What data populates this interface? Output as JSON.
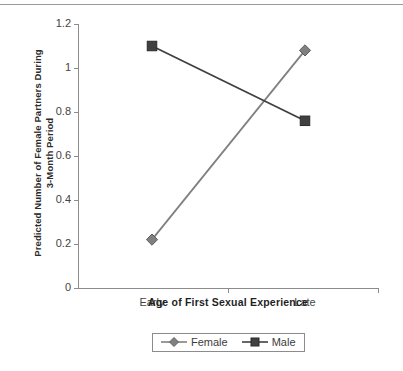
{
  "chart_data": {
    "type": "line",
    "title": "",
    "subtitle": "",
    "xlabel": "Age of First Sexual Experience",
    "ylabel": "Predicted Number of Female Partners During 3-Month Period",
    "ylabel_line1": "Predicted Number of Female Partners During",
    "ylabel_line2": "3-Month Period",
    "categories": [
      "Early",
      "Late"
    ],
    "series": [
      {
        "name": "Female",
        "values": [
          0.22,
          1.08
        ],
        "color": "#808080",
        "marker": "diamond"
      },
      {
        "name": "Male",
        "values": [
          1.1,
          0.76
        ],
        "color": "#404040",
        "marker": "square"
      }
    ],
    "ylim": [
      0,
      1.2
    ],
    "ytick_values": [
      0,
      0.2,
      0.4,
      0.6,
      0.8,
      1,
      1.2
    ],
    "ytick_labels": [
      "0",
      "0.2",
      "0.4",
      "0.6",
      "0.8",
      "1",
      "1.2"
    ],
    "xtick_labels": [
      "Early",
      "Late"
    ],
    "grid": false,
    "legend_position": "bottom",
    "legend_entries": [
      "Female",
      "Male"
    ],
    "axis_color": "#8c8c8c"
  },
  "legend": {
    "items": [
      {
        "label": "Female",
        "icon": "diamond-marker-icon"
      },
      {
        "label": "Male",
        "icon": "square-marker-icon"
      }
    ]
  }
}
